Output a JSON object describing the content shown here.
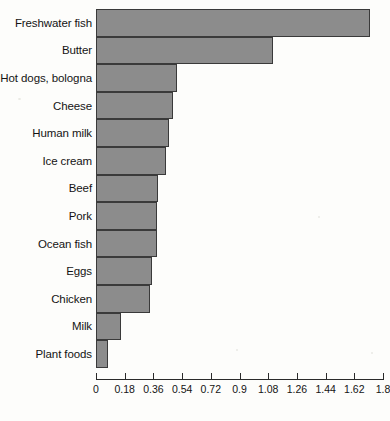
{
  "chart_data": {
    "type": "bar",
    "orientation": "horizontal",
    "title": "",
    "xlabel": "",
    "ylabel": "",
    "xlim": [
      0,
      1.8
    ],
    "grid": false,
    "legend": null,
    "xticks": [
      "0",
      "0.18",
      "0.36",
      "0.54",
      "0.72",
      "0.9",
      "1.08",
      "1.26",
      "1.44",
      "1.62",
      "1.8"
    ],
    "xtick_values": [
      0,
      0.18,
      0.36,
      0.54,
      0.72,
      0.9,
      1.08,
      1.26,
      1.44,
      1.62,
      1.8
    ],
    "categories": [
      "Freshwater fish",
      "Butter",
      "Hot dogs, bologna",
      "Cheese",
      "Human milk",
      "Ice cream",
      "Beef",
      "Pork",
      "Ocean fish",
      "Eggs",
      "Chicken",
      "Milk",
      "Plant foods"
    ],
    "values": [
      1.72,
      1.11,
      0.51,
      0.48,
      0.46,
      0.44,
      0.39,
      0.385,
      0.38,
      0.35,
      0.34,
      0.155,
      0.075
    ],
    "bar_fill_color": "#8c8c8c",
    "bar_border_color": "#3a3a3a",
    "axis_color": "#2a2a2a",
    "background_color": "#fdfdfb"
  }
}
